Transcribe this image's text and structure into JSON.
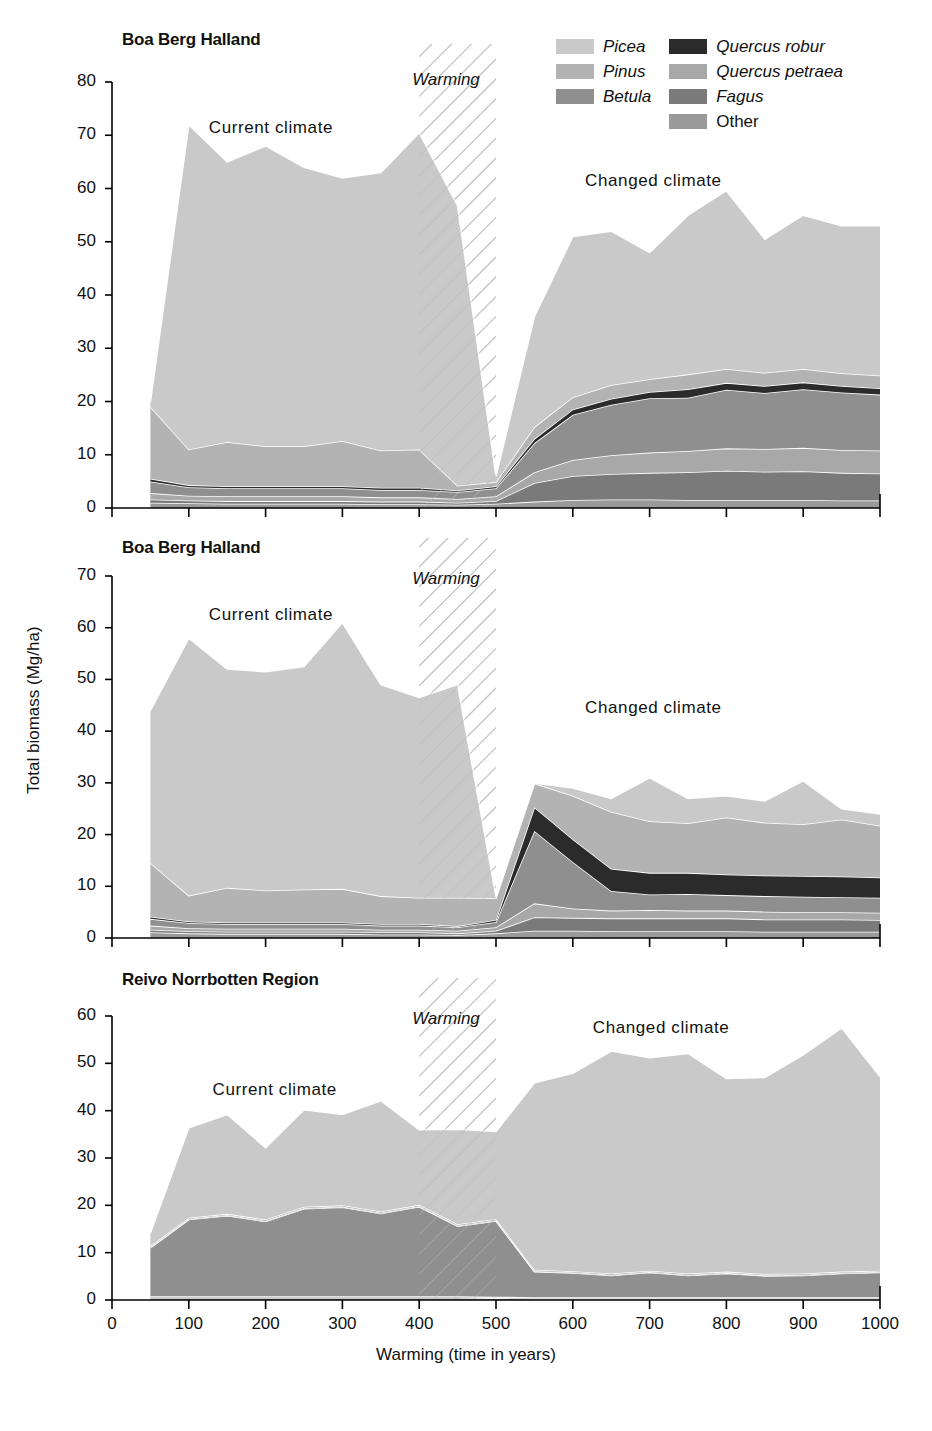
{
  "figure": {
    "y_axis_title": "Total biomass (Mg/ha)",
    "x_axis_title": "Warming (time in years)",
    "width": 932,
    "height": 1431
  },
  "legend": {
    "columns": [
      {
        "items": [
          {
            "label": "Picea",
            "color": "#c9c9c9",
            "italic": true
          },
          {
            "label": "Pinus",
            "color": "#b3b3b3",
            "italic": true
          },
          {
            "label": "Betula",
            "color": "#8f8f8f",
            "italic": true
          }
        ]
      },
      {
        "items": [
          {
            "label": "Quercus robur",
            "color": "#2b2b2b",
            "italic": true
          },
          {
            "label": "Quercus petraea",
            "color": "#a8a8a8",
            "italic": true
          },
          {
            "label": "Fagus",
            "color": "#7a7a7a",
            "italic": true
          },
          {
            "label": "Other",
            "color": "#9a9a9a",
            "italic": false
          }
        ]
      }
    ]
  },
  "colors": {
    "picea": "#c9c9c9",
    "pinus": "#b3b3b3",
    "betula": "#8f8f8f",
    "quercus_robur": "#2b2b2b",
    "quercus_petraea": "#a8a8a8",
    "fagus": "#7a7a7a",
    "other": "#9a9a9a",
    "axis": "#000000",
    "separator": "#ffffff",
    "hatch": "#b9b9b9"
  },
  "chart_data": [
    {
      "id": "panel-1",
      "type": "area",
      "stacked": true,
      "title": "Boa Berg Halland",
      "xlabel": "",
      "ylabel": "Total biomass (Mg/ha)",
      "xlim": [
        0,
        1000
      ],
      "ylim": [
        0,
        80
      ],
      "yticks": [
        0,
        10,
        20,
        30,
        40,
        50,
        60,
        70,
        80
      ],
      "xticks": [
        0,
        100,
        200,
        300,
        400,
        500,
        600,
        700,
        800,
        900,
        1000
      ],
      "grid": false,
      "legend_position": "top-right",
      "annotations": [
        {
          "text": "Current climate",
          "x": 210,
          "y": 71
        },
        {
          "text": "Warming",
          "x": 430,
          "y": 80,
          "italic": true
        },
        {
          "text": "Changed climate",
          "x": 700,
          "y": 61
        }
      ],
      "warming_band": [
        400,
        500
      ],
      "x": [
        50,
        100,
        150,
        200,
        250,
        300,
        350,
        400,
        450,
        500,
        550,
        600,
        650,
        700,
        750,
        800,
        850,
        900,
        950,
        1000
      ],
      "series": [
        {
          "name": "Other",
          "key": "other",
          "values": [
            1.0,
            0.9,
            0.8,
            0.8,
            0.8,
            0.8,
            0.7,
            0.7,
            0.6,
            0.8,
            1.2,
            1.5,
            1.6,
            1.6,
            1.5,
            1.5,
            1.5,
            1.5,
            1.4,
            1.4
          ]
        },
        {
          "name": "Fagus",
          "key": "fagus",
          "values": [
            0.6,
            0.5,
            0.5,
            0.5,
            0.5,
            0.5,
            0.5,
            0.5,
            0.4,
            0.5,
            3.5,
            4.5,
            4.8,
            5.0,
            5.2,
            5.5,
            5.3,
            5.4,
            5.2,
            5.1
          ]
        },
        {
          "name": "Quercus petraea",
          "key": "quercus_petraea",
          "values": [
            1.2,
            0.9,
            0.9,
            0.9,
            0.9,
            0.9,
            0.8,
            0.8,
            0.7,
            0.9,
            2.0,
            3.0,
            3.5,
            3.8,
            4.0,
            4.2,
            4.3,
            4.4,
            4.3,
            4.3
          ]
        },
        {
          "name": "Betula",
          "key": "betula",
          "values": [
            2.2,
            1.6,
            1.5,
            1.5,
            1.5,
            1.5,
            1.4,
            1.4,
            1.3,
            1.5,
            5.5,
            8.5,
            9.5,
            10.2,
            10.0,
            11.0,
            10.5,
            11.0,
            10.8,
            10.5
          ]
        },
        {
          "name": "Quercus robur",
          "key": "quercus_robur",
          "values": [
            0.5,
            0.4,
            0.4,
            0.4,
            0.4,
            0.4,
            0.4,
            0.4,
            0.3,
            0.4,
            0.8,
            1.0,
            1.1,
            1.2,
            1.6,
            1.3,
            1.3,
            1.3,
            1.2,
            1.2
          ]
        },
        {
          "name": "Pinus",
          "key": "pinus",
          "values": [
            13.5,
            6.7,
            8.3,
            7.5,
            7.5,
            8.5,
            7.0,
            7.2,
            0.9,
            0.8,
            2.2,
            2.3,
            2.6,
            2.4,
            2.8,
            2.6,
            2.5,
            2.5,
            2.4,
            2.4
          ]
        },
        {
          "name": "Picea",
          "key": "picea",
          "values": [
            1.0,
            61.0,
            52.6,
            56.4,
            52.4,
            49.4,
            52.2,
            59.5,
            52.6,
            1.1,
            20.8,
            30.2,
            28.9,
            23.8,
            29.9,
            33.5,
            25.1,
            28.9,
            27.7,
            28.1
          ]
        }
      ]
    },
    {
      "id": "panel-2",
      "type": "area",
      "stacked": true,
      "title": "Boa Berg Halland",
      "xlabel": "",
      "ylabel": "Total biomass (Mg/ha)",
      "xlim": [
        0,
        1000
      ],
      "ylim": [
        0,
        70
      ],
      "yticks": [
        0,
        10,
        20,
        30,
        40,
        50,
        60,
        70
      ],
      "xticks": [
        0,
        100,
        200,
        300,
        400,
        500,
        600,
        700,
        800,
        900,
        1000
      ],
      "grid": false,
      "legend_position": "none",
      "annotations": [
        {
          "text": "Current climate",
          "x": 210,
          "y": 62
        },
        {
          "text": "Warming",
          "x": 430,
          "y": 69,
          "italic": true
        },
        {
          "text": "Changed climate",
          "x": 700,
          "y": 44
        }
      ],
      "warming_band": [
        400,
        500
      ],
      "x": [
        50,
        100,
        150,
        200,
        250,
        300,
        350,
        400,
        450,
        500,
        550,
        600,
        650,
        700,
        750,
        800,
        850,
        900,
        950,
        1000
      ],
      "series": [
        {
          "name": "Other",
          "key": "other",
          "values": [
            1.1,
            0.9,
            0.8,
            0.8,
            0.8,
            0.8,
            0.7,
            0.7,
            0.6,
            0.9,
            1.4,
            1.4,
            1.3,
            1.3,
            1.3,
            1.3,
            1.2,
            1.2,
            1.2,
            1.2
          ]
        },
        {
          "name": "Fagus",
          "key": "fagus",
          "values": [
            0.5,
            0.4,
            0.4,
            0.4,
            0.4,
            0.4,
            0.4,
            0.4,
            0.3,
            0.5,
            2.6,
            2.5,
            2.5,
            2.5,
            2.5,
            2.5,
            2.4,
            2.4,
            2.4,
            2.3
          ]
        },
        {
          "name": "Quercus petraea",
          "key": "quercus_petraea",
          "values": [
            0.8,
            0.6,
            0.6,
            0.6,
            0.6,
            0.6,
            0.5,
            0.5,
            0.5,
            0.7,
            2.7,
            1.8,
            1.5,
            1.6,
            1.5,
            1.5,
            1.5,
            1.4,
            1.4,
            1.4
          ]
        },
        {
          "name": "Betula",
          "key": "betula",
          "values": [
            1.3,
            1.0,
            0.9,
            0.9,
            0.9,
            0.9,
            0.8,
            0.8,
            0.7,
            1.0,
            14.0,
            9.0,
            3.8,
            3.0,
            3.2,
            3.0,
            3.0,
            3.0,
            2.9,
            2.9
          ]
        },
        {
          "name": "Quercus robur",
          "key": "quercus_robur",
          "values": [
            0.4,
            0.3,
            0.3,
            0.3,
            0.3,
            0.3,
            0.3,
            0.3,
            0.2,
            0.4,
            4.6,
            4.4,
            4.3,
            4.2,
            4.1,
            4.0,
            4.0,
            4.0,
            4.0,
            3.9
          ]
        },
        {
          "name": "Pinus",
          "key": "pinus",
          "values": [
            10.4,
            5.0,
            6.7,
            6.2,
            6.4,
            6.5,
            5.4,
            5.1,
            5.5,
            4.2,
            4.6,
            8.4,
            11.0,
            10.0,
            9.6,
            11.0,
            10.2,
            10.0,
            11.0,
            10.0
          ]
        },
        {
          "name": "Picea",
          "key": "picea",
          "values": [
            29.5,
            49.8,
            42.3,
            42.3,
            43.1,
            51.5,
            40.9,
            38.7,
            41.2,
            0.3,
            0.1,
            1.5,
            2.6,
            8.4,
            4.8,
            4.2,
            4.2,
            8.4,
            2.1,
            2.3
          ]
        }
      ]
    },
    {
      "id": "panel-3",
      "type": "area",
      "stacked": true,
      "title": "Reivo Norrbotten Region",
      "xlabel": "Warming (time in years)",
      "ylabel": "Total biomass (Mg/ha)",
      "xlim": [
        0,
        1000
      ],
      "ylim": [
        0,
        60
      ],
      "yticks": [
        0,
        10,
        20,
        30,
        40,
        50,
        60
      ],
      "xticks": [
        0,
        100,
        200,
        300,
        400,
        500,
        600,
        700,
        800,
        900,
        1000
      ],
      "grid": false,
      "legend_position": "none",
      "annotations": [
        {
          "text": "Current climate",
          "x": 215,
          "y": 44
        },
        {
          "text": "Warming",
          "x": 430,
          "y": 59,
          "italic": true
        },
        {
          "text": "Changed climate",
          "x": 710,
          "y": 57
        }
      ],
      "warming_band": [
        400,
        500
      ],
      "x": [
        50,
        100,
        150,
        200,
        250,
        300,
        350,
        400,
        450,
        500,
        550,
        600,
        650,
        700,
        750,
        800,
        850,
        900,
        950,
        1000
      ],
      "series": [
        {
          "name": "Other",
          "key": "other",
          "values": [
            0.5,
            0.5,
            0.5,
            0.5,
            0.5,
            0.5,
            0.5,
            0.5,
            0.5,
            0.4,
            0.3,
            0.3,
            0.3,
            0.3,
            0.3,
            0.3,
            0.3,
            0.3,
            0.3,
            0.3
          ]
        },
        {
          "name": "Fagus",
          "key": "fagus",
          "values": [
            0.2,
            0.2,
            0.2,
            0.2,
            0.2,
            0.2,
            0.2,
            0.2,
            0.2,
            0.2,
            0.2,
            0.2,
            0.2,
            0.2,
            0.2,
            0.2,
            0.2,
            0.2,
            0.2,
            0.2
          ]
        },
        {
          "name": "Quercus petraea",
          "key": "quercus_petraea",
          "values": [
            0.1,
            0.1,
            0.1,
            0.1,
            0.1,
            0.1,
            0.1,
            0.1,
            0.1,
            0.1,
            0.1,
            0.1,
            0.1,
            0.1,
            0.1,
            0.1,
            0.1,
            0.1,
            0.1,
            0.1
          ]
        },
        {
          "name": "Betula",
          "key": "betula",
          "values": [
            10.2,
            16.2,
            17.0,
            15.8,
            18.5,
            18.8,
            17.5,
            18.9,
            14.8,
            16.0,
            5.4,
            5.1,
            4.6,
            5.2,
            4.6,
            5.0,
            4.5,
            4.6,
            5.0,
            5.2
          ]
        },
        {
          "name": "Quercus robur",
          "key": "quercus_robur",
          "values": [
            0.1,
            0.1,
            0.1,
            0.1,
            0.1,
            0.1,
            0.1,
            0.1,
            0.1,
            0.1,
            0.1,
            0.1,
            0.1,
            0.1,
            0.1,
            0.1,
            0.1,
            0.1,
            0.1,
            0.1
          ]
        },
        {
          "name": "Pinus",
          "key": "pinus",
          "values": [
            0.3,
            0.3,
            0.3,
            0.3,
            0.3,
            0.3,
            0.3,
            0.3,
            0.3,
            0.3,
            0.3,
            0.3,
            0.3,
            0.3,
            0.3,
            0.3,
            0.3,
            0.3,
            0.3,
            0.3
          ]
        },
        {
          "name": "Picea",
          "key": "picea",
          "values": [
            2.8,
            19.0,
            21.0,
            15.2,
            20.5,
            19.2,
            23.4,
            15.9,
            20.1,
            18.5,
            39.5,
            41.8,
            47.0,
            45.0,
            46.5,
            40.8,
            41.5,
            46.2,
            51.5,
            41.0
          ]
        }
      ]
    }
  ]
}
